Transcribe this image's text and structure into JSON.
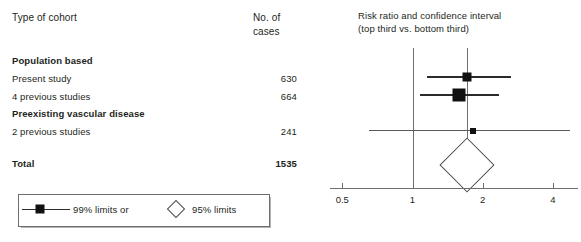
{
  "table": {
    "header_cohort": "Type of cohort",
    "header_cases_line1": "No. of",
    "header_cases_line2": "cases",
    "rows": [
      {
        "label": "Population based",
        "value": "",
        "bold": true,
        "y": 55
      },
      {
        "label": "Present study",
        "value": "630",
        "bold": false,
        "y": 73
      },
      {
        "label": "4 previous studies",
        "value": "664",
        "bold": false,
        "y": 91
      },
      {
        "label": "Preexisting vascular disease",
        "value": "",
        "bold": true,
        "y": 108
      },
      {
        "label": "2 previous studies",
        "value": "241",
        "bold": false,
        "y": 126
      },
      {
        "label": "Total",
        "value": "1535",
        "bold": true,
        "y": 158
      }
    ]
  },
  "plot": {
    "title_line1": "Risk ratio and confidence interval",
    "title_line2": "(top third vs. bottom third)"
  },
  "legend": {
    "limits_99_label": "99% limits or",
    "limits_95_label": "95% limits",
    "marker_99_icon": "filled-square-with-line",
    "marker_95_icon": "open-diamond"
  },
  "chart_data": {
    "type": "forest",
    "title": "Risk ratio and confidence interval (top third vs. bottom third)",
    "xlabel": "",
    "ylabel": "",
    "xscale": "log",
    "xlim": [
      0.42,
      4.8
    ],
    "ticks": [
      0.5,
      1,
      2,
      4
    ],
    "tick_labels": [
      "0.5",
      "1",
      "2",
      "4"
    ],
    "grid": false,
    "null_line": 1,
    "summary_line": 1.72,
    "legend_position": "below-left",
    "entries": [
      {
        "label": "Present study",
        "cases": 630,
        "rr": 1.72,
        "ci_low": 1.15,
        "ci_high": 2.65,
        "ci_level": "99%",
        "marker": "square",
        "marker_size": 9
      },
      {
        "label": "4 previous studies",
        "cases": 664,
        "rr": 1.58,
        "ci_low": 1.08,
        "ci_high": 2.35,
        "ci_level": "99%",
        "marker": "square",
        "marker_size": 13
      },
      {
        "label": "2 previous studies",
        "cases": 241,
        "rr": 1.82,
        "ci_low": 0.65,
        "ci_high": 4.75,
        "ci_level": "99%",
        "marker": "square",
        "marker_size": 6
      }
    ],
    "summary": {
      "label": "Total",
      "cases": 1535,
      "rr": 1.72,
      "ci_low": 1.33,
      "ci_high": 2.23,
      "ci_level": "95%",
      "marker": "diamond"
    }
  }
}
